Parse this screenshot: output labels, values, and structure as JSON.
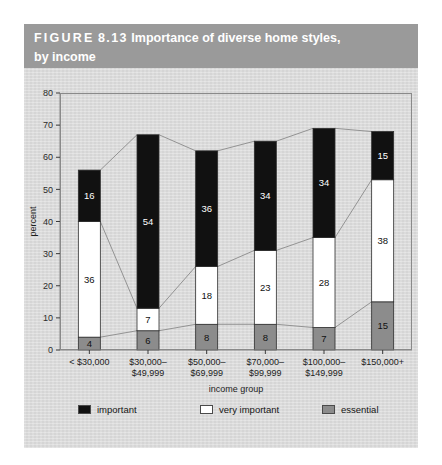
{
  "figure": {
    "label_word": "FIGURE",
    "label_number": "8.13",
    "title_main": "Importance of diverse home styles,",
    "title_second_line": "by income"
  },
  "colors": {
    "header_bg": "#9a9a9a",
    "panel_bg": "#dcdcdc",
    "important": "#111111",
    "very_important": "#ffffff",
    "essential": "#8c8c8c",
    "frame": "#8a8a8a",
    "connector": "#8a8a8a"
  },
  "legend": {
    "position": "bottom",
    "items": [
      {
        "label": "important",
        "key": "important",
        "color": "#111111"
      },
      {
        "label": "very important",
        "key": "very_important",
        "color": "#ffffff"
      },
      {
        "label": "essential",
        "key": "essential",
        "color": "#8c8c8c"
      }
    ]
  },
  "chart_data": {
    "type": "bar",
    "subtype": "stacked",
    "title": "FIGURE 8.13 Importance of diverse home styles, by income",
    "xlabel": "income group",
    "ylabel": "percent",
    "ylim": [
      0,
      80
    ],
    "yticks": [
      0,
      10,
      20,
      30,
      40,
      50,
      60,
      70,
      80
    ],
    "ytick_labels": [
      "0",
      "10",
      "20",
      "30",
      "40",
      "50",
      "60",
      "70",
      "80"
    ],
    "grid": false,
    "categories": [
      "< $30,000",
      "$30,000–$49,999",
      "$50,000–$69,999",
      "$70,000–$99,999",
      "$100,000–$149,999",
      "$150,000+"
    ],
    "category_lines": [
      [
        "< $30,000"
      ],
      [
        "$30,000–",
        "$49,999"
      ],
      [
        "$50,000–",
        "$69,999"
      ],
      [
        "$70,000–",
        "$99,999"
      ],
      [
        "$100,000–",
        "$149,999"
      ],
      [
        "$150,000+"
      ]
    ],
    "stack_order_bottom_to_top": [
      "essential",
      "very_important",
      "important"
    ],
    "series": [
      {
        "name": "essential",
        "values": [
          4,
          6,
          8,
          8,
          7,
          15
        ]
      },
      {
        "name": "very important",
        "values": [
          36,
          7,
          18,
          23,
          28,
          38
        ]
      },
      {
        "name": "important",
        "values": [
          16,
          54,
          36,
          34,
          34,
          15
        ]
      }
    ],
    "totals": [
      56,
      67,
      62,
      65,
      69,
      68
    ]
  }
}
